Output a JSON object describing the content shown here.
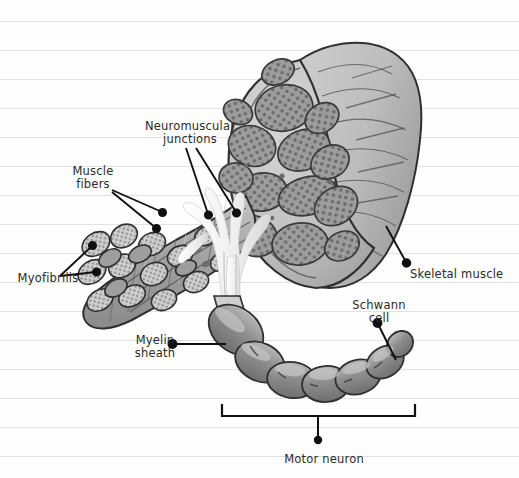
{
  "page": {
    "clipped_header_text": "· · ·   · ·",
    "background": "ruled-notebook-paper",
    "rule_color": "#e2e2e4",
    "paper_color": "#fefefe"
  },
  "palette": {
    "outline": "#2f2f2f",
    "muscle_body_light": "#c8c8c8",
    "muscle_body_mid": "#b4b4b4",
    "fascicle_fill": "#9d9d9d",
    "fascicle_dot": "#6b6b6b",
    "perimysium": "#a8a8a8",
    "fiber_bundle": "#9a9a9a",
    "fiber_light": "#c2c2c2",
    "myofibril_fill": "#cfcfcf",
    "myofibril_stipple": "#777777",
    "axon_white": "#f2f2f2",
    "myelin_fill": "#8f8f8f",
    "myelin_light": "#b6b6b6",
    "leader_line": "#101010",
    "text": "#2a2a2a"
  },
  "labels": [
    {
      "id": "neuromuscular-junctions",
      "text": "Neuromuscular\njunctions",
      "x": 135,
      "y": 120,
      "width": 110
    },
    {
      "id": "muscle-fibers",
      "text": "Muscle\nfibers",
      "x": 62,
      "y": 165,
      "width": 62
    },
    {
      "id": "myofibrilis",
      "text": "Myofibrilis",
      "x": 10,
      "y": 272,
      "width": 76
    },
    {
      "id": "skeletal-muscle",
      "text": "Skeletal muscle",
      "x": 410,
      "y": 268,
      "width": 100
    },
    {
      "id": "schwann-cell",
      "text": "Schwann\ncell",
      "x": 348,
      "y": 299,
      "width": 62
    },
    {
      "id": "myelin-sheath",
      "text": "Myelin\nsheath",
      "x": 126,
      "y": 334,
      "width": 58
    },
    {
      "id": "motor-neuron",
      "text": "Motor neuron",
      "x": 276,
      "y": 455,
      "width": 96
    }
  ],
  "diagram": {
    "title_semantic": "neuromuscular-junction-anatomy",
    "parts": [
      {
        "name": "skeletal-muscle-cross-section",
        "description": "cut end of skeletal muscle showing fascicles"
      },
      {
        "name": "muscle-fascicle",
        "count": 14,
        "description": "rounded bundles filled with muscle fiber dots"
      },
      {
        "name": "muscle-fiber-bundle",
        "description": "cylindrical striated muscle fibers, cut ends exposed"
      },
      {
        "name": "myofibril-cylinder",
        "count": 13,
        "description": "stippled cut fiber ends"
      },
      {
        "name": "axon-terminal-branches",
        "description": "white branching nerve endings forming junctions"
      },
      {
        "name": "myelinated-axon",
        "description": "chain of myelin sheath segments curving to lower right"
      },
      {
        "name": "schwann-cell-segment",
        "description": "terminal myelin segment"
      }
    ],
    "motor_neuron_bracket": {
      "x1": 222,
      "x2": 415,
      "y": 416,
      "tick_height": 12,
      "stem_to_y": 440
    }
  }
}
